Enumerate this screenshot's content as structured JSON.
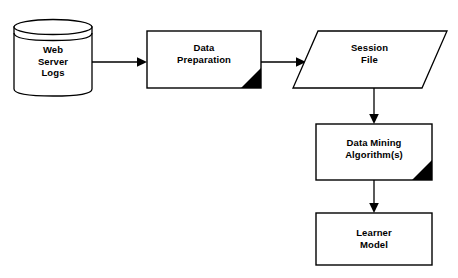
{
  "diagram": {
    "type": "flowchart",
    "background_color": "#ffffff",
    "stroke_color": "#000000",
    "fill_color": "#ffffff",
    "accent_color": "#000000",
    "nodes": [
      {
        "id": "web-server-logs",
        "shape": "cylinder",
        "label": "Web\nServer\nLogs",
        "lines": [
          "Web",
          "Server",
          "Logs"
        ],
        "has_corner_triangle": false
      },
      {
        "id": "data-preparation",
        "shape": "rectangle",
        "label": "Data\nPreparation",
        "lines": [
          "Data",
          "Preparation"
        ],
        "has_corner_triangle": true
      },
      {
        "id": "session-file",
        "shape": "parallelogram",
        "label": "Session\nFile",
        "lines": [
          "Session",
          "File"
        ],
        "has_corner_triangle": false
      },
      {
        "id": "data-mining-algorithms",
        "shape": "rectangle",
        "label": "Data Mining\nAlgorithm(s)",
        "lines": [
          "Data Mining",
          "Algorithm(s)"
        ],
        "has_corner_triangle": true
      },
      {
        "id": "learner-model",
        "shape": "rectangle",
        "label": "Learner\nModel",
        "lines": [
          "Learner",
          "Model"
        ],
        "has_corner_triangle": false
      }
    ],
    "edges": [
      {
        "id": "logs-to-preparation",
        "from": "web-server-logs",
        "to": "data-preparation",
        "direction": "right"
      },
      {
        "id": "preparation-to-session",
        "from": "data-preparation",
        "to": "session-file",
        "direction": "right"
      },
      {
        "id": "session-to-mining",
        "from": "session-file",
        "to": "data-mining-algorithms",
        "direction": "down"
      },
      {
        "id": "mining-to-learner",
        "from": "data-mining-algorithms",
        "to": "learner-model",
        "direction": "down"
      }
    ]
  }
}
